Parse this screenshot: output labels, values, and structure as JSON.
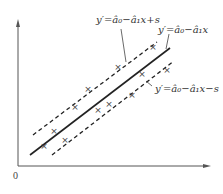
{
  "diagram": {
    "type": "linear-regression-band",
    "origin_label": "0",
    "labels": {
      "upper": "y′=â₀−â₁x+s",
      "center": "y′=â₀−â₁x",
      "lower": "y′=â₀−â₁x−s"
    },
    "lines": [
      {
        "name": "upper-bound",
        "style": "dashed",
        "label_key": "upper"
      },
      {
        "name": "regression",
        "style": "solid",
        "label_key": "center"
      },
      {
        "name": "lower-bound",
        "style": "dashed",
        "label_key": "lower"
      }
    ],
    "points_marker": "×",
    "points_count": 12,
    "colors": {
      "line": "#222222",
      "axis": "#555555",
      "text": "#333333"
    }
  }
}
